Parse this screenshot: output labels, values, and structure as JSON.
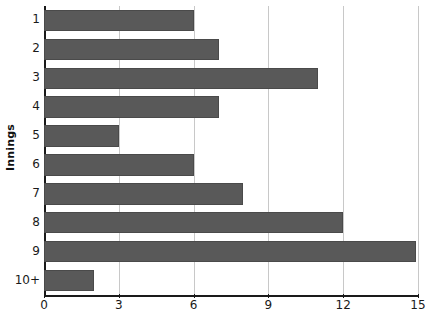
{
  "chart_data": {
    "type": "bar",
    "orientation": "horizontal",
    "title": "",
    "xlabel": "",
    "ylabel": "Innings",
    "categories": [
      "1",
      "2",
      "3",
      "4",
      "5",
      "6",
      "7",
      "8",
      "9",
      "10+"
    ],
    "values": [
      6,
      7,
      11,
      7,
      3,
      6,
      8,
      12,
      14.9,
      2
    ],
    "xlim": [
      0,
      15
    ],
    "xticks": [
      0,
      3,
      6,
      9,
      12,
      15
    ],
    "xtick_labels": [
      "0",
      "3",
      "6",
      "9",
      "12",
      "15"
    ],
    "grid": "vertical",
    "legend": "none",
    "bar_color": "#595959",
    "gridline_color": "#c8c8c8",
    "axis_color": "#1a1a1a"
  }
}
